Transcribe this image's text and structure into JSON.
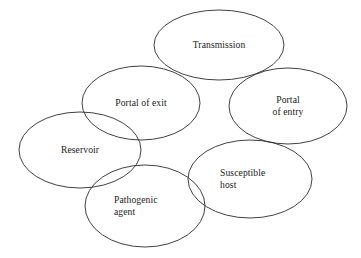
{
  "diagram": {
    "background_color": "#ffffff",
    "stroke_color": "#2b2b2b",
    "text_color": "#1a1a1a",
    "shape": "ellipse",
    "nodes": [
      {
        "id": "transmission",
        "label": "Transmission",
        "cx": 219,
        "cy": 45,
        "rx": 65,
        "ry": 35,
        "label_x": 180,
        "label_y": 39,
        "label_w": 78,
        "align": "center"
      },
      {
        "id": "portal-of-exit",
        "label": "Portal of exit",
        "cx": 141,
        "cy": 103,
        "rx": 59,
        "ry": 37,
        "label_x": 104,
        "label_y": 97,
        "label_w": 74,
        "align": "center"
      },
      {
        "id": "portal-of-entry",
        "label": "Portal\nof entry",
        "cx": 288,
        "cy": 106,
        "rx": 59,
        "ry": 38,
        "label_x": 252,
        "label_y": 94,
        "label_w": 72,
        "align": "center"
      },
      {
        "id": "reservoir",
        "label": "Reservoir",
        "cx": 80,
        "cy": 150,
        "rx": 61,
        "ry": 38,
        "label_x": 45,
        "label_y": 144,
        "label_w": 70,
        "align": "center"
      },
      {
        "id": "susceptible-host",
        "label": "Susceptible\nhost",
        "cx": 250,
        "cy": 179,
        "rx": 62,
        "ry": 39,
        "label_x": 220,
        "label_y": 167,
        "label_w": 74,
        "align": "left"
      },
      {
        "id": "pathogenic-agent",
        "label": "Pathogenic\nagent",
        "cx": 145,
        "cy": 206,
        "rx": 60,
        "ry": 41,
        "label_x": 114,
        "label_y": 194,
        "label_w": 74,
        "align": "left"
      }
    ]
  }
}
